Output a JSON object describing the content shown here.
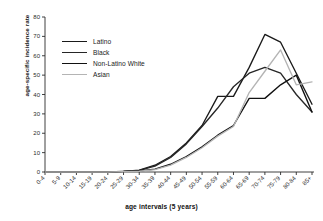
{
  "chart_data": {
    "type": "line",
    "title": "",
    "xlabel": "age intervals (5 years)",
    "ylabel": "age-specific incidence rate",
    "categories": [
      "0-4",
      "5-9",
      "10-14",
      "15-19",
      "20-24",
      "25-29",
      "30-34",
      "35-39",
      "40-44",
      "45-49",
      "50-54",
      "55-59",
      "60-64",
      "65-69",
      "70-74",
      "75-79",
      "80-84",
      "85+"
    ],
    "ylim": [
      0,
      80
    ],
    "yticks": [
      0,
      10,
      20,
      30,
      40,
      50,
      60,
      70,
      80
    ],
    "grid": false,
    "legend_position": "upper-left-inside",
    "series": [
      {
        "name": "Latino",
        "color": "#1a1a1a",
        "values": [
          0,
          0,
          0,
          0,
          0,
          0.3,
          1.0,
          3.5,
          8.0,
          15.0,
          24.0,
          39.0,
          39.0,
          54.0,
          71.0,
          67.0,
          51.0,
          35.0
        ]
      },
      {
        "name": "Black",
        "color": "#262626",
        "values": [
          0,
          0,
          0,
          0,
          0,
          0.3,
          0.8,
          3.0,
          7.5,
          14.5,
          23.5,
          33.0,
          44.0,
          51.0,
          54.0,
          51.0,
          40.0,
          31.0
        ]
      },
      {
        "name": "Non-Latino White",
        "color": "#111111",
        "values": [
          0,
          0,
          0,
          0,
          0,
          0.3,
          0.5,
          1.5,
          4.0,
          8.0,
          13.0,
          19.0,
          24.0,
          38.0,
          38.0,
          45.0,
          50.0,
          31.0
        ]
      },
      {
        "name": "Asian",
        "color": "#b4b4b4",
        "values": [
          0,
          0,
          0,
          0,
          0,
          0.2,
          0.4,
          1.2,
          3.5,
          7.5,
          12.5,
          18.5,
          23.5,
          41.0,
          52.0,
          63.0,
          45.0,
          46.5
        ]
      }
    ]
  },
  "legend": {
    "items": [
      {
        "label": "Latino"
      },
      {
        "label": "Black"
      },
      {
        "label": "Non-Latino White"
      },
      {
        "label": "Asian"
      }
    ]
  },
  "axes": {
    "y_title": "age-specific incidence rate",
    "x_title": "age intervals (5 years)"
  }
}
